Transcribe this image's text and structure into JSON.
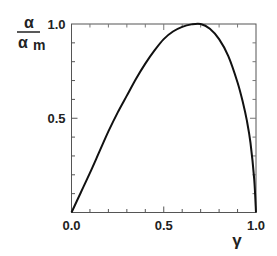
{
  "chart_data": {
    "type": "line",
    "title": "",
    "xlabel": "γ",
    "ylabel_numerator": "α",
    "ylabel_denominator": "α",
    "ylabel_denominator_sub": "m",
    "xlim": [
      0.0,
      1.0
    ],
    "ylim": [
      0.0,
      1.0
    ],
    "grid": false,
    "legend": null,
    "x_ticks": [
      {
        "value": 0.0,
        "label": "0.0"
      },
      {
        "value": 0.5,
        "label": "0.5"
      },
      {
        "value": 1.0,
        "label": "1.0"
      }
    ],
    "y_ticks": [
      {
        "value": 0.5,
        "label": "0.5"
      },
      {
        "value": 1.0,
        "label": "1.0"
      }
    ],
    "minor_tick_step": 0.1,
    "series": [
      {
        "name": "α/α_m vs γ",
        "color": "#111111",
        "x": [
          0.0,
          0.05,
          0.1,
          0.15,
          0.2,
          0.25,
          0.3,
          0.35,
          0.4,
          0.45,
          0.5,
          0.55,
          0.6,
          0.65,
          0.7,
          0.75,
          0.8,
          0.85,
          0.9,
          0.93,
          0.95,
          0.97,
          0.99,
          1.0
        ],
        "values": [
          0.0,
          0.105,
          0.21,
          0.32,
          0.43,
          0.53,
          0.62,
          0.71,
          0.79,
          0.86,
          0.92,
          0.96,
          0.985,
          0.998,
          1.0,
          0.975,
          0.92,
          0.83,
          0.69,
          0.58,
          0.49,
          0.37,
          0.18,
          0.0
        ]
      }
    ]
  }
}
